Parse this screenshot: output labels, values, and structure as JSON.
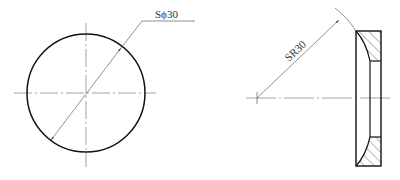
{
  "views": {
    "front_view": {
      "shape": "circle",
      "dimension_label": "Sϕ30",
      "dimension_type": "spherical-diameter"
    },
    "section_view": {
      "shape": "washer-section-with-spherical-seat",
      "dimension_label": "SR30",
      "dimension_type": "spherical-radius"
    }
  },
  "colors": {
    "outline": "#111111",
    "thin_line": "#555555",
    "text": "#333333",
    "background": "#ffffff"
  }
}
